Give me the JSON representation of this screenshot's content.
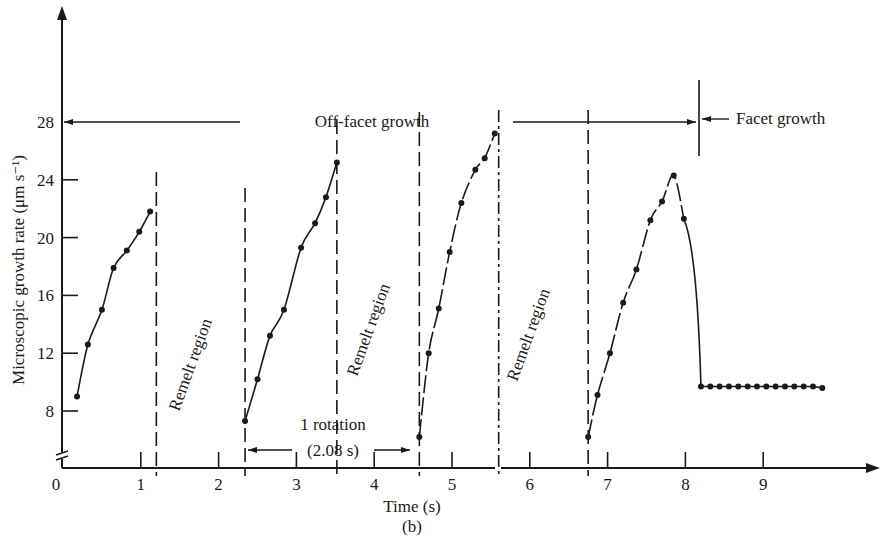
{
  "chart_data": {
    "type": "scatter",
    "title": "",
    "subtitle": "(b)",
    "xlabel": "Time (s)",
    "ylabel": "Microscopic growth rate (μm s⁻¹)",
    "xlim": [
      0,
      10
    ],
    "ylim": [
      8,
      28
    ],
    "y_axis_break": true,
    "grid": false,
    "x_ticks": [
      0,
      1,
      2,
      3,
      4,
      5,
      6,
      7,
      8,
      9
    ],
    "y_ticks": [
      8,
      12,
      16,
      20,
      24,
      28
    ],
    "series": [
      {
        "name": "Off-facet growth segment 1",
        "x": [
          0.18,
          0.32,
          0.5,
          0.65,
          0.82,
          0.98,
          1.12
        ],
        "y": [
          9.0,
          12.6,
          15.0,
          17.9,
          19.1,
          20.4,
          21.8
        ]
      },
      {
        "name": "Off-facet growth segment 2",
        "x": [
          2.34,
          2.5,
          2.66,
          2.84,
          3.06,
          3.24,
          3.38,
          3.52
        ],
        "y": [
          7.3,
          10.2,
          13.2,
          15.0,
          19.3,
          21.0,
          22.8,
          25.2
        ]
      },
      {
        "name": "Off-facet growth segment 3",
        "x": [
          4.58,
          4.7,
          4.83,
          4.97,
          5.12,
          5.3,
          5.42,
          5.55
        ],
        "y": [
          6.2,
          12.0,
          15.1,
          19.0,
          22.4,
          24.7,
          25.5,
          27.2
        ]
      },
      {
        "name": "Off-facet growth segment 4",
        "x": [
          6.75,
          6.87,
          7.03,
          7.2,
          7.37,
          7.55,
          7.7,
          7.85,
          7.98
        ],
        "y": [
          6.2,
          9.1,
          12.0,
          15.5,
          17.8,
          21.2,
          22.5,
          24.3,
          21.3
        ]
      },
      {
        "name": "Facet growth",
        "x": [
          8.2,
          8.32,
          8.44,
          8.56,
          8.68,
          8.8,
          8.92,
          9.04,
          9.16,
          9.28,
          9.4,
          9.52,
          9.64,
          9.76
        ],
        "y": [
          9.7,
          9.7,
          9.7,
          9.7,
          9.7,
          9.7,
          9.7,
          9.7,
          9.7,
          9.7,
          9.7,
          9.7,
          9.7,
          9.6
        ]
      }
    ],
    "annotations": [
      {
        "text": "Off-facet growth",
        "type": "range-arrow",
        "y": 28,
        "x_range": [
          0,
          8.2
        ]
      },
      {
        "text": "Facet growth",
        "type": "arrow-label",
        "y": 28,
        "x": 8.2
      },
      {
        "text": "Remelt region",
        "type": "rotated-label",
        "x_range": [
          1.2,
          2.34
        ]
      },
      {
        "text": "Remelt region",
        "type": "rotated-label",
        "x_range": [
          3.52,
          4.58
        ]
      },
      {
        "text": "Remelt region",
        "type": "rotated-label",
        "x_range": [
          5.6,
          6.75
        ]
      },
      {
        "text": "1 rotation",
        "type": "dimension",
        "x_range": [
          2.34,
          4.58
        ]
      },
      {
        "text": "(2.08 s)",
        "type": "dimension",
        "x_range": [
          2.34,
          4.58
        ]
      }
    ],
    "dashed_verticals_x": [
      1.2,
      2.34,
      3.52,
      4.58,
      5.6,
      6.75
    ],
    "solid_vertical_x": 8.2
  },
  "labels": {
    "y_axis_title": "Microscopic growth rate (μm s⁻¹)",
    "x_axis_title": "Time (s)",
    "panel": "(b)",
    "off_facet": "Off-facet growth",
    "facet": "Facet growth",
    "remelt_1": "Remelt region",
    "remelt_2": "Remelt region",
    "remelt_3": "Remelt region",
    "rotation_line1": "1 rotation",
    "rotation_line2": "(2.08 s)",
    "x_ticks": [
      "0",
      "1",
      "2",
      "3",
      "4",
      "5",
      "6",
      "7",
      "8",
      "9"
    ],
    "y_ticks": [
      "8",
      "12",
      "16",
      "20",
      "24",
      "28"
    ]
  },
  "colors": {
    "ink": "#1a1a1a",
    "background": "#ffffff"
  }
}
